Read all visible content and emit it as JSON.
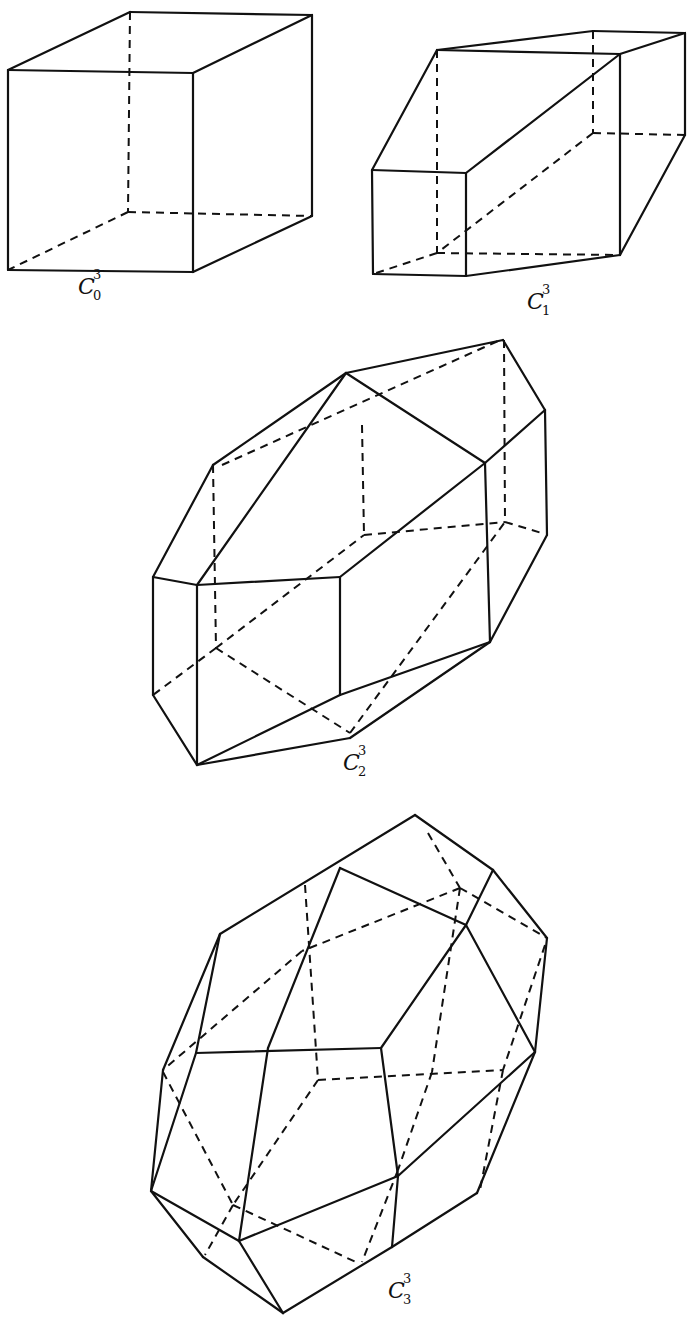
{
  "figure": {
    "ink_color": "#111111",
    "background": "#ffffff"
  },
  "polytopes": [
    {
      "id": "c0",
      "label": {
        "base": "C",
        "sup": "3",
        "sub": "0",
        "x": 78,
        "y": 276
      },
      "solid": [
        [
          [
            8,
            70
          ],
          [
            193,
            73
          ]
        ],
        [
          [
            193,
            73
          ],
          [
            193,
            272
          ]
        ],
        [
          [
            193,
            272
          ],
          [
            8,
            270
          ]
        ],
        [
          [
            8,
            270
          ],
          [
            8,
            70
          ]
        ],
        [
          [
            8,
            70
          ],
          [
            130,
            12
          ]
        ],
        [
          [
            130,
            12
          ],
          [
            312,
            15
          ]
        ],
        [
          [
            312,
            15
          ],
          [
            193,
            73
          ]
        ],
        [
          [
            312,
            15
          ],
          [
            312,
            216
          ]
        ],
        [
          [
            312,
            216
          ],
          [
            193,
            272
          ]
        ]
      ],
      "dashed": [
        [
          [
            130,
            12
          ],
          [
            128,
            212
          ]
        ],
        [
          [
            128,
            212
          ],
          [
            312,
            216
          ]
        ],
        [
          [
            128,
            212
          ],
          [
            8,
            270
          ]
        ]
      ]
    },
    {
      "id": "c1",
      "label": {
        "base": "C",
        "sup": "3",
        "sub": "1",
        "x": 527,
        "y": 291
      },
      "solid": [
        [
          [
            372,
            170
          ],
          [
            466,
            173
          ]
        ],
        [
          [
            466,
            173
          ],
          [
            466,
            276
          ]
        ],
        [
          [
            466,
            276
          ],
          [
            373,
            274
          ]
        ],
        [
          [
            373,
            274
          ],
          [
            372,
            170
          ]
        ],
        [
          [
            372,
            170
          ],
          [
            437,
            50
          ]
        ],
        [
          [
            437,
            50
          ],
          [
            620,
            54
          ]
        ],
        [
          [
            437,
            50
          ],
          [
            593,
            31
          ]
        ],
        [
          [
            593,
            31
          ],
          [
            685,
            33
          ]
        ],
        [
          [
            685,
            33
          ],
          [
            620,
            54
          ]
        ],
        [
          [
            620,
            54
          ],
          [
            620,
            255
          ]
        ],
        [
          [
            685,
            33
          ],
          [
            685,
            135
          ]
        ],
        [
          [
            685,
            135
          ],
          [
            620,
            255
          ]
        ],
        [
          [
            466,
            173
          ],
          [
            620,
            54
          ]
        ],
        [
          [
            466,
            276
          ],
          [
            620,
            255
          ]
        ]
      ],
      "dashed": [
        [
          [
            437,
            50
          ],
          [
            437,
            253
          ]
        ],
        [
          [
            437,
            253
          ],
          [
            373,
            274
          ]
        ],
        [
          [
            437,
            253
          ],
          [
            620,
            255
          ]
        ],
        [
          [
            593,
            31
          ],
          [
            593,
            133
          ]
        ],
        [
          [
            593,
            133
          ],
          [
            685,
            135
          ]
        ],
        [
          [
            593,
            133
          ],
          [
            437,
            253
          ]
        ]
      ]
    },
    {
      "id": "c2",
      "label": {
        "base": "C",
        "sup": "3",
        "sub": "2",
        "x": 343,
        "y": 752
      },
      "solid": [
        [
          [
            213,
            465
          ],
          [
            346,
            373
          ]
        ],
        [
          [
            346,
            373
          ],
          [
            503,
            340
          ]
        ],
        [
          [
            503,
            340
          ],
          [
            545,
            410
          ]
        ],
        [
          [
            346,
            373
          ],
          [
            485,
            463
          ]
        ],
        [
          [
            545,
            410
          ],
          [
            485,
            463
          ]
        ],
        [
          [
            213,
            465
          ],
          [
            153,
            577
          ]
        ],
        [
          [
            153,
            577
          ],
          [
            197,
            585
          ]
        ],
        [
          [
            197,
            585
          ],
          [
            340,
            577
          ]
        ],
        [
          [
            197,
            585
          ],
          [
            346,
            373
          ]
        ],
        [
          [
            340,
            577
          ],
          [
            485,
            463
          ]
        ],
        [
          [
            485,
            463
          ],
          [
            490,
            642
          ]
        ],
        [
          [
            545,
            410
          ],
          [
            547,
            535
          ]
        ],
        [
          [
            547,
            535
          ],
          [
            490,
            642
          ]
        ],
        [
          [
            340,
            577
          ],
          [
            340,
            695
          ]
        ],
        [
          [
            340,
            695
          ],
          [
            490,
            642
          ]
        ],
        [
          [
            153,
            577
          ],
          [
            153,
            695
          ]
        ],
        [
          [
            153,
            695
          ],
          [
            197,
            765
          ]
        ],
        [
          [
            197,
            585
          ],
          [
            197,
            765
          ]
        ],
        [
          [
            197,
            765
          ],
          [
            340,
            695
          ]
        ],
        [
          [
            197,
            765
          ],
          [
            350,
            738
          ]
        ],
        [
          [
            350,
            738
          ],
          [
            490,
            642
          ]
        ]
      ],
      "dashed": [
        [
          [
            222,
            465
          ],
          [
            498,
            341
          ]
        ],
        [
          [
            213,
            465
          ],
          [
            216,
            648
          ]
        ],
        [
          [
            362,
            425
          ],
          [
            364,
            535
          ]
        ],
        [
          [
            504,
            340
          ],
          [
            505,
            522
          ]
        ],
        [
          [
            364,
            535
          ],
          [
            505,
            522
          ]
        ],
        [
          [
            505,
            522
          ],
          [
            545,
            534
          ]
        ],
        [
          [
            216,
            648
          ],
          [
            153,
            695
          ]
        ],
        [
          [
            216,
            648
          ],
          [
            350,
            733
          ]
        ],
        [
          [
            216,
            648
          ],
          [
            364,
            535
          ]
        ],
        [
          [
            350,
            733
          ],
          [
            505,
            522
          ]
        ]
      ]
    },
    {
      "id": "c3",
      "label": {
        "base": "C",
        "sup": "3",
        "sub": "3",
        "x": 388,
        "y": 1280
      },
      "solid": [
        [
          [
            220,
            934
          ],
          [
            415,
            815
          ]
        ],
        [
          [
            415,
            815
          ],
          [
            493,
            870
          ]
        ],
        [
          [
            493,
            870
          ],
          [
            547,
            938
          ]
        ],
        [
          [
            340,
            868
          ],
          [
            466,
            925
          ]
        ],
        [
          [
            493,
            870
          ],
          [
            466,
            925
          ]
        ],
        [
          [
            340,
            868
          ],
          [
            268,
            1048
          ]
        ],
        [
          [
            466,
            925
          ],
          [
            381,
            1048
          ]
        ],
        [
          [
            466,
            925
          ],
          [
            535,
            1052
          ]
        ],
        [
          [
            547,
            938
          ],
          [
            535,
            1052
          ]
        ],
        [
          [
            535,
            1052
          ],
          [
            477,
            1193
          ]
        ],
        [
          [
            220,
            934
          ],
          [
            196,
            1053
          ]
        ],
        [
          [
            220,
            934
          ],
          [
            163,
            1070
          ]
        ],
        [
          [
            196,
            1053
          ],
          [
            381,
            1048
          ]
        ],
        [
          [
            381,
            1048
          ],
          [
            398,
            1176
          ]
        ],
        [
          [
            268,
            1048
          ],
          [
            239,
            1241
          ]
        ],
        [
          [
            239,
            1241
          ],
          [
            398,
            1176
          ]
        ],
        [
          [
            398,
            1176
          ],
          [
            535,
            1052
          ]
        ],
        [
          [
            398,
            1176
          ],
          [
            392,
            1247
          ]
        ],
        [
          [
            196,
            1053
          ],
          [
            151,
            1191
          ]
        ],
        [
          [
            163,
            1070
          ],
          [
            151,
            1191
          ]
        ],
        [
          [
            151,
            1191
          ],
          [
            239,
            1241
          ]
        ],
        [
          [
            151,
            1191
          ],
          [
            203,
            1257
          ]
        ],
        [
          [
            203,
            1257
          ],
          [
            283,
            1313
          ]
        ],
        [
          [
            239,
            1241
          ],
          [
            283,
            1313
          ]
        ],
        [
          [
            283,
            1313
          ],
          [
            392,
            1247
          ]
        ],
        [
          [
            392,
            1247
          ],
          [
            477,
            1193
          ]
        ]
      ],
      "dashed": [
        [
          [
            428,
            833
          ],
          [
            460,
            888
          ]
        ],
        [
          [
            460,
            888
          ],
          [
            547,
            938
          ]
        ],
        [
          [
            460,
            888
          ],
          [
            302,
            951
          ]
        ],
        [
          [
            302,
            951
          ],
          [
            163,
            1070
          ]
        ],
        [
          [
            305,
            885
          ],
          [
            318,
            1080
          ]
        ],
        [
          [
            318,
            1080
          ],
          [
            503,
            1070
          ]
        ],
        [
          [
            460,
            888
          ],
          [
            432,
            1072
          ]
        ],
        [
          [
            432,
            1072
          ],
          [
            398,
            1170
          ]
        ],
        [
          [
            398,
            1170
          ],
          [
            362,
            1262
          ]
        ],
        [
          [
            545,
            945
          ],
          [
            503,
            1070
          ]
        ],
        [
          [
            503,
            1070
          ],
          [
            480,
            1190
          ]
        ],
        [
          [
            163,
            1072
          ],
          [
            233,
            1205
          ]
        ],
        [
          [
            318,
            1080
          ],
          [
            233,
            1205
          ]
        ],
        [
          [
            233,
            1205
          ],
          [
            205,
            1255
          ]
        ],
        [
          [
            233,
            1205
          ],
          [
            358,
            1263
          ]
        ]
      ]
    }
  ]
}
